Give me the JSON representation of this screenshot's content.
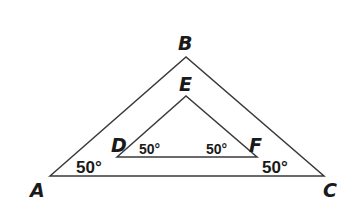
{
  "diagram": {
    "outer_triangle": {
      "vertices": {
        "A": [
          50,
          176
        ],
        "B": [
          186,
          57
        ],
        "C": [
          324,
          176
        ]
      },
      "labels": {
        "A": "A",
        "B": "B",
        "C": "C"
      },
      "angle_A": "50°",
      "angle_C": "50°"
    },
    "inner_triangle": {
      "vertices": {
        "D": [
          117,
          157
        ],
        "E": [
          186,
          96
        ],
        "F": [
          257,
          157
        ]
      },
      "labels": {
        "D": "D",
        "E": "E",
        "F": "F"
      },
      "angle_D": "50°",
      "angle_F": "50°"
    },
    "line_color": "#3a3a3a"
  }
}
